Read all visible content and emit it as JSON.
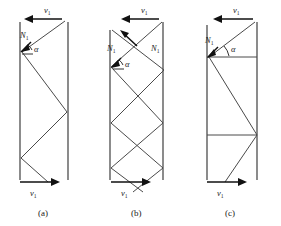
{
  "figure": {
    "panels": [
      {
        "id": "a",
        "caption": "(a)",
        "top_velocity_label": "v",
        "top_velocity_sub": "1",
        "top_velocity_direction": "left",
        "bottom_velocity_label": "v",
        "bottom_velocity_sub": "1",
        "bottom_velocity_direction": "right",
        "normals": [
          {
            "label": "N",
            "sub": "1",
            "x": 22,
            "y": 40
          }
        ],
        "angle_label": "α",
        "pattern": "single-zigzag"
      },
      {
        "id": "b",
        "caption": "(b)",
        "top_velocity_label": "v",
        "top_velocity_sub": "1",
        "top_velocity_direction": "left",
        "bottom_velocity_label": "v",
        "bottom_velocity_sub": "1",
        "bottom_velocity_direction": "right",
        "normals": [
          {
            "label": "N",
            "sub": "1",
            "x": 16,
            "y": 47
          },
          {
            "label": "N",
            "sub": "1",
            "x": 62,
            "y": 47
          }
        ],
        "angle_label": "α",
        "pattern": "double-crossing-zigzag"
      },
      {
        "id": "c",
        "caption": "(c)",
        "top_velocity_label": "v",
        "top_velocity_sub": "1",
        "top_velocity_direction": "left",
        "bottom_velocity_label": "v",
        "bottom_velocity_sub": "1",
        "bottom_velocity_direction": "right",
        "normals": [
          {
            "label": "N",
            "sub": "1",
            "x": 22,
            "y": 42
          }
        ],
        "angle_label": "α",
        "pattern": "zigzag-with-horizontal-chords"
      }
    ],
    "colors": {
      "wall": "#6f6f6f",
      "ray": "#4a4a4a",
      "vector": "#111111",
      "background": "#ffffff"
    }
  }
}
